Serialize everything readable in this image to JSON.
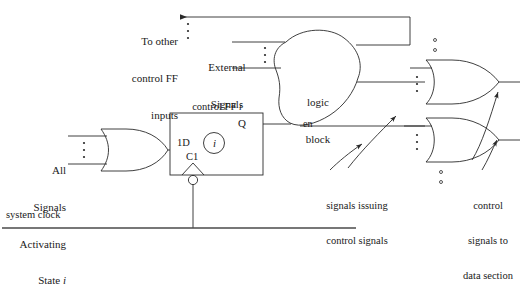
{
  "diagram": {
    "labels": {
      "to_other_ff": "To other\ncontrol FF\ninputs",
      "external_signals": "External\nSignals",
      "logic_block": "logic\nblock",
      "enable": "en",
      "control_ff": "control FF i",
      "ff_q": "Q",
      "ff_d": "1D",
      "ff_c": "C1",
      "ff_state": "i",
      "all_signals": "All\nSignals\nActivating\nState i",
      "all_signals_lines": [
        "All",
        "Signals",
        "Activating",
        "State i"
      ],
      "system_clock": "system clock",
      "signals_issuing": "signals issuing\ncontrol signals",
      "signals_issuing_lines": [
        "signals issuing",
        "control signals"
      ],
      "control_to_data": "control\nsignals to\ndata section",
      "control_to_data_lines": [
        "control",
        "signals to",
        "data section"
      ]
    },
    "colors": {
      "stroke": "#2a2a2a",
      "text": "#1a1a1a",
      "background": "#ffffff",
      "thick_line": "#4a4a4a"
    },
    "elements": {
      "or_gate_input": "OR gate collecting all signals activating state i",
      "or_gate_top": "OR gate producing control signal output (top)",
      "or_gate_bottom": "OR gate producing control signal output (bottom)",
      "flip_flop": "control FF i",
      "logic_cloud": "logic block"
    },
    "ellipsis_marks": {
      "to_other_ff_dots": 3,
      "external_signal_dots": 3,
      "all_signals_dots": 3,
      "or_top_input_dots": 3,
      "or_bottom_input_dots": 3,
      "between_gates_dots": 2,
      "below_bottom_gate_dots": 2
    }
  }
}
